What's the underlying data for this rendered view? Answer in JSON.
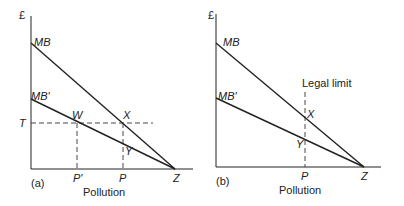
{
  "panel_a": {
    "y_axis_label": "£",
    "curve_mb": "MB",
    "curve_mb_prime": "MB'",
    "tax_label": "T",
    "point_w": "W",
    "point_x": "X",
    "point_y": "Y",
    "tick_p_prime": "P'",
    "tick_p": "P",
    "tick_z": "Z",
    "panel_tag": "(a)",
    "x_axis_label": "Pollution"
  },
  "panel_b": {
    "y_axis_label": "£",
    "curve_mb": "MB",
    "curve_mb_prime": "MB'",
    "legal_limit_label": "Legal limit",
    "point_x": "X",
    "point_y": "Y",
    "tick_p": "P",
    "tick_z": "Z",
    "panel_tag": "(b)",
    "x_axis_label": "Pollution"
  }
}
